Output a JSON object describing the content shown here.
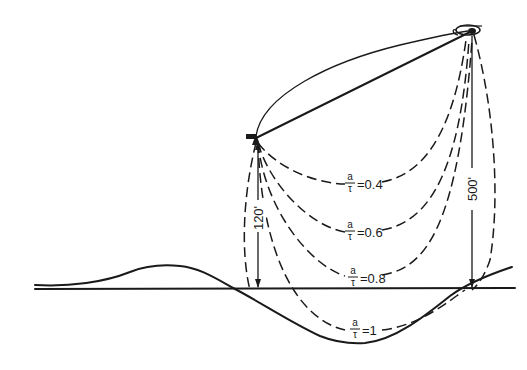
{
  "diagram": {
    "type": "trajectory-diagram",
    "colors": {
      "ink": "#1a1a1a",
      "background": "#ffffff"
    },
    "objects": {
      "helicopter_icon": "helicopter-icon",
      "pickup_point_icon": "pickup-point-icon"
    },
    "curves": [
      {
        "id": "a04",
        "numerator": "a",
        "denominator": "τ",
        "value": "=0.4"
      },
      {
        "id": "a06",
        "numerator": "a",
        "denominator": "τ",
        "value": "=0.6"
      },
      {
        "id": "a08",
        "numerator": "a",
        "denominator": "τ",
        "value": "=0.8"
      },
      {
        "id": "a1",
        "numerator": "a",
        "denominator": "τ",
        "value": "=1"
      }
    ],
    "dimensions": {
      "left_height": "120'",
      "right_height": "500'"
    }
  }
}
